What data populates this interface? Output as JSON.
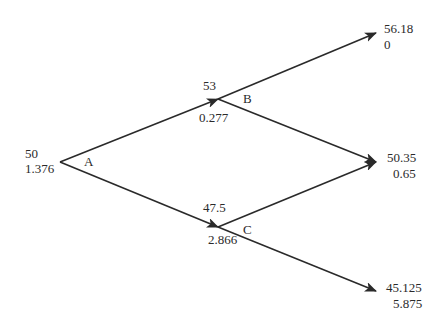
{
  "diagram": {
    "type": "binomial-tree",
    "nodes": {
      "A": {
        "label": "A",
        "price": "50",
        "value": "1.376"
      },
      "B": {
        "label": "B",
        "price": "53",
        "value": "0.277"
      },
      "C": {
        "label": "C",
        "price": "47.5",
        "value": "2.866"
      },
      "UU": {
        "price": "56.18",
        "value": "0"
      },
      "UD": {
        "price": "50.35",
        "value": "0.65"
      },
      "DD": {
        "price": "45.125",
        "value": "5.875"
      }
    },
    "edges": [
      [
        "A",
        "B"
      ],
      [
        "A",
        "C"
      ],
      [
        "B",
        "UU"
      ],
      [
        "B",
        "UD"
      ],
      [
        "C",
        "UD"
      ],
      [
        "C",
        "DD"
      ]
    ],
    "colors": {
      "line": "#2a2a2a",
      "text": "#2a2a2a",
      "background": "#ffffff"
    }
  }
}
